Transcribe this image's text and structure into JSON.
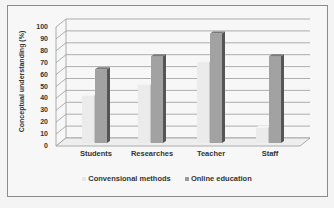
{
  "chart_data": {
    "type": "bar",
    "title": "",
    "xlabel": "",
    "ylabel": "Conceptual understanding (%)",
    "ylim": [
      0,
      100
    ],
    "yticks": [
      0,
      10,
      20,
      30,
      40,
      50,
      60,
      70,
      80,
      90,
      100
    ],
    "categories": [
      "Students",
      "Researches",
      "Teacher",
      "Staff"
    ],
    "series": [
      {
        "name": "Convensional methods",
        "values": [
          40,
          49,
          68,
          13
        ],
        "color": "#e6e6e6"
      },
      {
        "name": "Online education",
        "values": [
          62,
          73,
          92,
          73
        ],
        "color": "#9a9a9a"
      }
    ],
    "grid": true,
    "legend_position": "bottom",
    "style": "3d-clustered-column"
  },
  "axis": {
    "ylabel": "Conceptual understanding (%)",
    "ticks": [
      "0",
      "10",
      "20",
      "30",
      "40",
      "50",
      "60",
      "70",
      "80",
      "90",
      "100"
    ]
  },
  "categories": [
    "Students",
    "Researches",
    "Teacher",
    "Staff"
  ],
  "legend": {
    "items": [
      {
        "label": "Convensional methods"
      },
      {
        "label": "Online education"
      }
    ]
  }
}
